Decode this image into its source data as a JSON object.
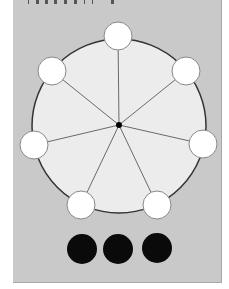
{
  "header": {
    "clipped_caption_visible": false,
    "clipped_caption_glyph_count": 10
  },
  "colors": {
    "page_background": "#ffffff",
    "panel_background": "#c9c9c9",
    "big_circle_fill": "#ececec",
    "big_circle_stroke": "#333333",
    "spoke_color": "#6a6a6a",
    "white_node_fill": "#ffffff",
    "white_node_stroke": "#888888",
    "black_node_fill": "#0a0a0a",
    "hub_color": "#000000"
  },
  "diagram": {
    "big_circle": {
      "cx": 119,
      "cy": 126,
      "r": 87
    },
    "hub": {
      "cx": 119,
      "cy": 125,
      "r": 3
    },
    "white_nodes": [
      {
        "id": "node-top",
        "cx": 118,
        "cy": 36,
        "r": 14
      },
      {
        "id": "node-upper-right",
        "cx": 186,
        "cy": 71,
        "r": 14
      },
      {
        "id": "node-right",
        "cx": 203,
        "cy": 144,
        "r": 14
      },
      {
        "id": "node-lower-right",
        "cx": 157,
        "cy": 205,
        "r": 14
      },
      {
        "id": "node-lower-left",
        "cx": 81,
        "cy": 205,
        "r": 14
      },
      {
        "id": "node-left",
        "cx": 34,
        "cy": 145,
        "r": 14
      },
      {
        "id": "node-upper-left",
        "cx": 52,
        "cy": 71,
        "r": 14
      }
    ],
    "black_nodes": [
      {
        "id": "black-1",
        "cx": 82,
        "cy": 249,
        "r": 15
      },
      {
        "id": "black-2",
        "cx": 118,
        "cy": 249,
        "r": 15
      },
      {
        "id": "black-3",
        "cx": 157,
        "cy": 248,
        "r": 15
      }
    ]
  }
}
